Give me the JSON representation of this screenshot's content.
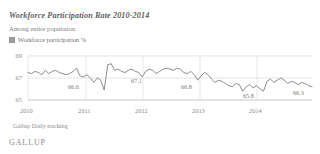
{
  "header": {
    "title": "Workforce Participation Rate 2010-2014",
    "subtitle": "Among entire population"
  },
  "legend": {
    "label": "Workforce participation %",
    "swatch_color": "#9a9a9a",
    "position": "top-left"
  },
  "footer": {
    "source": "Gallup Daily tracking",
    "brand": "GALLUP"
  },
  "chart_data": {
    "type": "line",
    "title": "Workforce Participation Rate 2010-2014",
    "subtitle": "Among entire population",
    "xlabel": "",
    "ylabel": "",
    "ylim": [
      65,
      69
    ],
    "yticks": [
      65,
      67,
      69
    ],
    "ytick_labels": [
      "65",
      "67",
      "69"
    ],
    "xticks": [
      2010,
      2011,
      2012,
      2013,
      2014
    ],
    "xtick_labels": [
      "2010",
      "2011",
      "2012",
      "2013",
      "2014"
    ],
    "grid": true,
    "line_color": "#808080",
    "series": [
      {
        "name": "Workforce participation %",
        "values": [
          67.5,
          67.4,
          67.6,
          67.5,
          67.3,
          67.7,
          67.4,
          67.6,
          67.7,
          67.5,
          67.4,
          67.3,
          67.4,
          67.6,
          67.9,
          67.2,
          67.1,
          67.3,
          67.0,
          66.6,
          67.0,
          66.8,
          65.9,
          68.2,
          68.3,
          67.7,
          67.8,
          67.6,
          67.5,
          67.7,
          67.8,
          67.6,
          67.5,
          67.1,
          67.6,
          67.8,
          67.7,
          67.4,
          67.6,
          67.8,
          67.9,
          67.8,
          67.7,
          67.9,
          67.8,
          67.5,
          67.4,
          67.6,
          67.3,
          66.8,
          67.2,
          67.5,
          67.3,
          66.9,
          66.6,
          66.8,
          66.7,
          66.5,
          66.3,
          66.2,
          66.5,
          66.4,
          65.8,
          66.2,
          66.4,
          66.1,
          66.3,
          66.0,
          65.8,
          66.7,
          66.9,
          66.6,
          66.8,
          67.0,
          66.8,
          66.5,
          66.7,
          66.6,
          66.4,
          66.6,
          66.5,
          66.3,
          66.2
        ]
      }
    ],
    "annotations": [
      {
        "label": "66.6",
        "value": 66.6
      },
      {
        "label": "67.1",
        "value": 67.1
      },
      {
        "label": "66.8",
        "value": 66.8
      },
      {
        "label": "65.8",
        "value": 65.8
      },
      {
        "label": "66.3",
        "value": 66.3
      }
    ]
  }
}
